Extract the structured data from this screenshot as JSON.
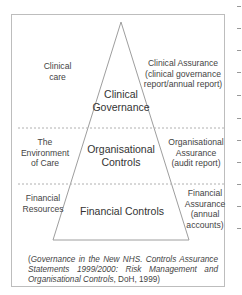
{
  "diagram": {
    "type": "pyramid",
    "tiers": [
      {
        "left_label": "Clinical care",
        "center_label": "Clinical Governance",
        "right_label": "Clinical Assurance (clinical governance report/annual report)"
      },
      {
        "left_label": "The Environment of Care",
        "center_label": "Organisational Controls",
        "right_label": "Organisational Assurance (audit report)"
      },
      {
        "left_label": "Financial Resources",
        "center_label": "Financial Controls",
        "right_label": "Financial Assurance (annual accounts)"
      }
    ],
    "tier_lines": {
      "t1_left": [
        "Clinical",
        "care"
      ],
      "t1_center": [
        "Clinical",
        "Governance"
      ],
      "t1_right": [
        "Clinical Assurance",
        "(clinical governance",
        "report/annual report)"
      ],
      "t2_left": [
        "The",
        "Environment",
        "of Care"
      ],
      "t2_center": [
        "Organisational",
        "Controls"
      ],
      "t2_right": [
        "Organisational",
        "Assurance",
        "(audit report)"
      ],
      "t3_left": [
        "Financial",
        "Resources"
      ],
      "t3_center": [
        "Financial Controls"
      ],
      "t3_right": [
        "Financial",
        "Assurance",
        "(annual",
        "accounts)"
      ]
    },
    "caption": {
      "open": "(",
      "italic_part": "Governance in the New NHS. Controls Assurance Statements 1999/2000: Risk Management and Organisational Controls",
      "plain_part": ", DoH, 1999)"
    },
    "colors": {
      "frame": "#bdbdbd",
      "lines": "#9e9e9e",
      "text": "#444444"
    }
  }
}
